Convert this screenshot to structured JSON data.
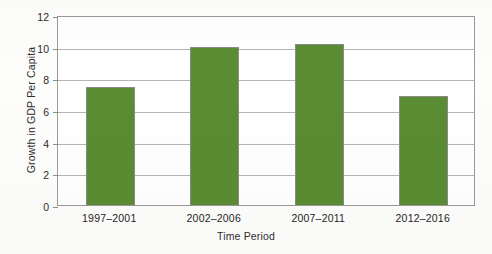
{
  "chart_data": {
    "type": "bar",
    "title": "",
    "xlabel": "Time Period",
    "ylabel": "Growth in GDP Per Capita",
    "categories": [
      "1997–2001",
      "2002–2006",
      "2007–2011",
      "2012–2016"
    ],
    "values": [
      7.45,
      10.0,
      10.2,
      6.9
    ],
    "series": [
      {
        "name": "Growth in GDP Per Capita",
        "values": [
          7.45,
          10.0,
          10.2,
          6.9
        ]
      }
    ],
    "ylim": [
      0,
      12
    ],
    "yticks": [
      0,
      2,
      4,
      6,
      8,
      10,
      12
    ],
    "ytick_labels": [
      "0",
      "2",
      "4",
      "6",
      "8",
      "10",
      "12"
    ],
    "grid": "horizontal",
    "legend": "none",
    "bar_color": "#5a8c33",
    "bar_border_color": "#8a8a8a",
    "gridline_color": "#b4b4b4",
    "plot_border_color": "#9a9a9a",
    "background_color": "#ffffff"
  }
}
